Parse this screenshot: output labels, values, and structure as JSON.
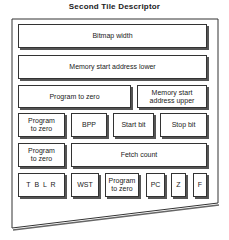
{
  "title": "Second Tile Descriptor",
  "rows": [
    {
      "cells": [
        {
          "label": "Bitmap width"
        }
      ]
    },
    {
      "cells": [
        {
          "label": "Memory start address lower"
        }
      ]
    },
    {
      "cells": [
        {
          "label": "Program to zero"
        },
        {
          "label": "Memory start address upper"
        }
      ]
    },
    {
      "cells": [
        {
          "label": "Program to zero"
        },
        {
          "label": "BPP"
        },
        {
          "label": "Start bit"
        },
        {
          "label": "Stop bit"
        }
      ]
    },
    {
      "cells": [
        {
          "label": "Program to zero"
        },
        {
          "label": "Fetch count"
        }
      ]
    },
    {
      "cells": [
        {
          "label": "T B L R"
        },
        {
          "label": "WST"
        },
        {
          "label": "Program to zero"
        },
        {
          "label": "PC"
        },
        {
          "label": "Z"
        },
        {
          "label": "F"
        }
      ]
    }
  ]
}
